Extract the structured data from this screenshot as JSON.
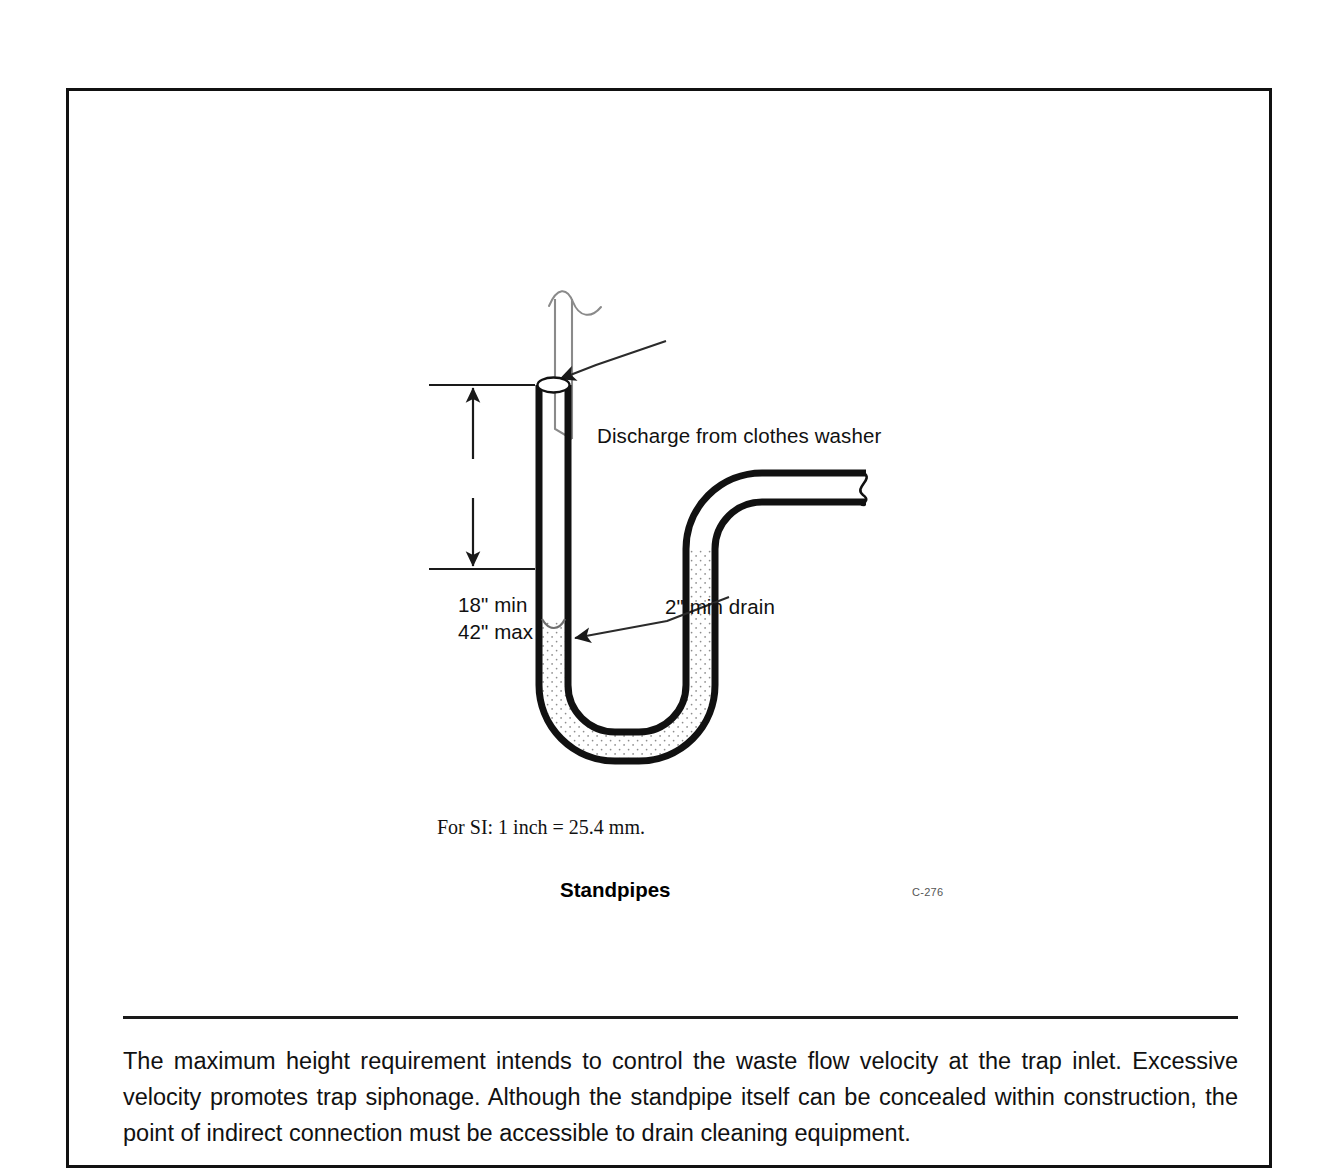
{
  "figure": {
    "title": "Standpipes",
    "number": "C-276",
    "si_note": "For SI: 1 inch = 25.4 mm.",
    "annotations": [
      {
        "id": "discharge",
        "text": "Discharge from clothes washer"
      },
      {
        "id": "drain",
        "text": "2\" min drain"
      }
    ],
    "dimension": {
      "min_label": "18\" min",
      "max_label": "42\" max"
    },
    "parts": {
      "washer_hose": "washer-discharge-hose",
      "standpipe": "standpipe-riser",
      "trap": "p-trap",
      "outlet": "horizontal-drain-outlet",
      "water_seal": "trap-water-seal"
    },
    "colors": {
      "line": "#1a1a1a",
      "pipe_wall": "#111111",
      "water_fill": "#fdfdfd",
      "stipple": "#8d8d8d",
      "thin_line": "#707070",
      "page_background": "#ffffff"
    }
  },
  "commentary": {
    "text": "The maximum height requirement intends to control the waste flow velocity at the trap inlet. Excessive velocity promotes trap siphonage. Although the standpipe itself can be concealed within construction, the point of indirect connection must be accessible to drain cleaning equipment."
  }
}
